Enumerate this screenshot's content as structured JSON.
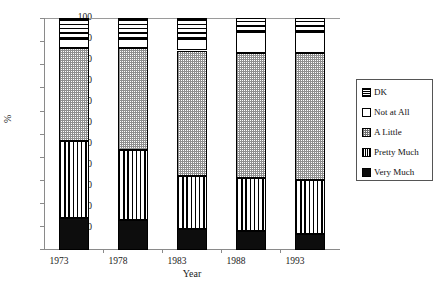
{
  "chart_data": {
    "type": "bar",
    "subtype": "stacked-bar-percent",
    "title": "",
    "xlabel": "Year",
    "ylabel": "%",
    "categories": [
      "1973",
      "1978",
      "1983",
      "1988",
      "1993"
    ],
    "ylim": [
      0,
      100
    ],
    "yticks": [
      0,
      10,
      20,
      30,
      40,
      50,
      60,
      70,
      80,
      90,
      100
    ],
    "ytick_labels": [
      "0",
      "10",
      "20",
      "30",
      "40",
      "50",
      "60",
      "70",
      "80",
      "90",
      "100"
    ],
    "grid": false,
    "legend_position": "right",
    "series": [
      {
        "name": "Very Much",
        "pattern": "solid-black",
        "values": [
          14,
          13,
          9,
          8,
          7
        ]
      },
      {
        "name": "Pretty Much",
        "pattern": "vertical-lines",
        "values": [
          33,
          30,
          23,
          23,
          23
        ]
      },
      {
        "name": "A Little",
        "pattern": "dotted-checker",
        "values": [
          40,
          44,
          54,
          54,
          55
        ]
      },
      {
        "name": "Not at All",
        "pattern": "white",
        "values": [
          4,
          4,
          5,
          9,
          9
        ]
      },
      {
        "name": "DK",
        "pattern": "horizontal-lines",
        "values": [
          9,
          9,
          9,
          6,
          6
        ]
      }
    ],
    "legend_entries": [
      "DK",
      "Not at All",
      "A Little",
      "Pretty Much",
      "Very Much"
    ],
    "colors": {
      "axis": "#8a8a8a",
      "outline": "#000000",
      "very_much": "#0d0d0d",
      "background": "#ffffff"
    }
  },
  "axis": {
    "y_title": "%",
    "x_title": "Year"
  }
}
